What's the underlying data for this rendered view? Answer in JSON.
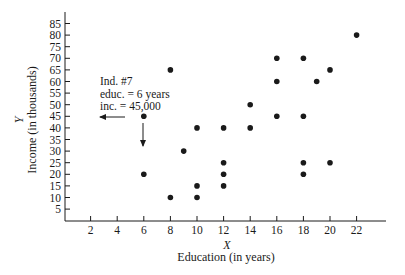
{
  "chart_data": {
    "type": "scatter",
    "title": "",
    "xlabel": "Education (in years)",
    "xvar": "X",
    "ylabel": "Income (in thousands)",
    "yvar": "Y",
    "xlim": [
      0,
      24
    ],
    "ylim": [
      0,
      88
    ],
    "xticks": [
      2,
      4,
      6,
      8,
      10,
      12,
      14,
      16,
      18,
      20,
      22
    ],
    "yticks": [
      5,
      10,
      15,
      20,
      25,
      30,
      35,
      40,
      45,
      50,
      55,
      60,
      65,
      70,
      75,
      80,
      85
    ],
    "grid": false,
    "legend": null,
    "points": [
      {
        "x": 6,
        "y": 45
      },
      {
        "x": 6,
        "y": 20
      },
      {
        "x": 8,
        "y": 65
      },
      {
        "x": 8,
        "y": 10
      },
      {
        "x": 9,
        "y": 30
      },
      {
        "x": 10,
        "y": 40
      },
      {
        "x": 10,
        "y": 15
      },
      {
        "x": 10,
        "y": 10
      },
      {
        "x": 12,
        "y": 40
      },
      {
        "x": 12,
        "y": 25
      },
      {
        "x": 12,
        "y": 20
      },
      {
        "x": 12,
        "y": 15
      },
      {
        "x": 14,
        "y": 50
      },
      {
        "x": 14,
        "y": 40
      },
      {
        "x": 16,
        "y": 70
      },
      {
        "x": 16,
        "y": 60
      },
      {
        "x": 16,
        "y": 45
      },
      {
        "x": 18,
        "y": 70
      },
      {
        "x": 18,
        "y": 45
      },
      {
        "x": 18,
        "y": 25
      },
      {
        "x": 18,
        "y": 20
      },
      {
        "x": 19,
        "y": 60
      },
      {
        "x": 20,
        "y": 65
      },
      {
        "x": 20,
        "y": 25
      },
      {
        "x": 22,
        "y": 80
      }
    ],
    "annotation": {
      "target": {
        "x": 6,
        "y": 45
      },
      "lines": [
        "Ind. #7",
        "educ. = 6 years",
        "inc. = 45,000"
      ],
      "arrows": [
        "left-toward-y-axis",
        "down-toward-x-axis"
      ]
    }
  },
  "colors": {
    "ink": "#1a1a1a",
    "background": "#ffffff"
  }
}
